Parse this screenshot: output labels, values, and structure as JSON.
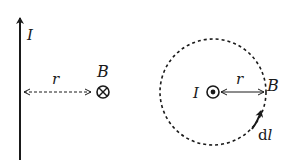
{
  "diagram": {
    "colors": {
      "stroke": "#1a1a1a",
      "background": "#ffffff"
    },
    "left_panel": {
      "current_label": "I",
      "distance_label": "r",
      "field_label": "B",
      "field_symbol": "into-page (⊗)"
    },
    "right_panel": {
      "current_label": "I",
      "current_symbol": "out-of-page (⊙)",
      "distance_label": "r",
      "field_label": "B",
      "path_element_label_d": "d",
      "path_element_label_l": "l",
      "loop_style": "dashed circle"
    }
  }
}
